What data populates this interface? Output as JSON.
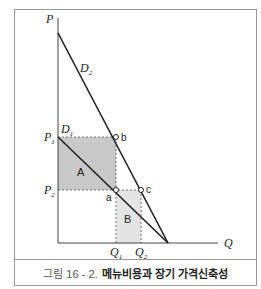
{
  "figure": {
    "axes": {
      "y_label": "P",
      "x_label": "Q"
    },
    "curves": [
      {
        "name": "D",
        "sub": "2"
      },
      {
        "name": "D",
        "sub": "1"
      }
    ],
    "prices": [
      {
        "name": "P",
        "sub": "1"
      },
      {
        "name": "P",
        "sub": "2"
      }
    ],
    "quantities": [
      {
        "name": "Q",
        "sub": "1"
      },
      {
        "name": "Q",
        "sub": "2"
      }
    ],
    "points": {
      "a": "a",
      "b": "b",
      "c": "c"
    },
    "regions": {
      "A": "A",
      "B": "B"
    },
    "colors": {
      "region_A": "#c8c8c8",
      "region_B": "#e4e4e4",
      "line": "#222222"
    }
  },
  "caption": {
    "number": "그림 16 - 2.",
    "title": "메뉴비용과 장기 가격신축성"
  }
}
